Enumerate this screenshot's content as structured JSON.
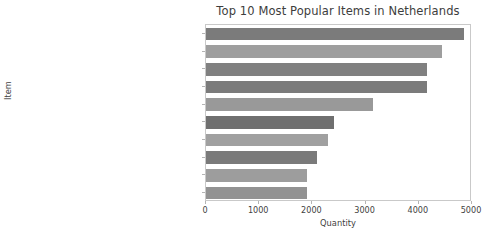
{
  "chart_data": {
    "type": "bar",
    "orientation": "horizontal",
    "title": "Top 10 Most Popular Items in Netherlands",
    "xlabel": "Quantity",
    "ylabel": "Item",
    "xlim": [
      0,
      5000
    ],
    "xticks": [
      0,
      1000,
      2000,
      3000,
      4000,
      5000
    ],
    "xtick_labels": [
      "0",
      "1000",
      "2000",
      "3000",
      "4000",
      "5000"
    ],
    "grid": false,
    "legend": null,
    "categories": [
      "RABBIT NIGHT LIGHT",
      "SPACEBOY LUNCH BOX",
      "DOLLY GIRL LUNCH BOX",
      "PACK OF 72 RETROSPOT CAKE CASES",
      "ROUND SNACK BOXES SET OF4 WOODLAND",
      "RED TOADSTOOL LED NIGHT LIGHT",
      "WOODLAND CHARLOTTE BAG",
      "RED RETROSPOT CHARLOTTE BAG",
      "5 HOOK HANGER RED MAGIC TOADSTOOL",
      "JUMBO BAG RED RETROSPOT"
    ],
    "values": [
      4850,
      4430,
      4150,
      4150,
      3130,
      2410,
      2300,
      2080,
      1890,
      1890
    ],
    "bar_colors": [
      "#7b7b7b",
      "#9e9e9e",
      "#808080",
      "#7b7b7b",
      "#999999",
      "#6f6f6f",
      "#a0a0a0",
      "#7a7a7a",
      "#9d9d9d",
      "#929292"
    ]
  }
}
